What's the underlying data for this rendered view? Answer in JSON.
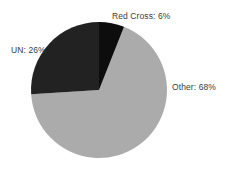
{
  "chart_data": {
    "type": "pie",
    "title": "",
    "categories": [
      "Red Cross",
      "UN",
      "Other"
    ],
    "values": [
      6,
      26,
      68
    ],
    "labels": [
      "Red Cross: 6%",
      "UN: 26%",
      "Other: 68%"
    ],
    "units": "percent",
    "total": 100,
    "legend_position": "none",
    "grid": false,
    "xlabel": "",
    "ylabel": "",
    "start_angle_deg": 0,
    "direction": "clockwise",
    "slices": [
      {
        "name": "Red Cross",
        "value": 6,
        "label": "Red Cross: 6%",
        "color": "#0d0d0d",
        "start_deg": 0,
        "end_deg": 21.6,
        "label_position": "top-right-outside"
      },
      {
        "name": "Other",
        "value": 68,
        "label": "Other: 68%",
        "color": "#ababab",
        "start_deg": 21.6,
        "end_deg": 266.4,
        "label_position": "right-outside"
      },
      {
        "name": "UN",
        "value": 26,
        "label": "UN: 26%",
        "color": "#222222",
        "start_deg": 266.4,
        "end_deg": 360,
        "label_position": "left-outside"
      }
    ]
  },
  "colors": {
    "background": "#ffffff",
    "red_cross_slice": "#0d0d0d",
    "un_slice": "#222222",
    "other_slice": "#ababab",
    "label_text": "#3a3a3a"
  },
  "geometry": {
    "center_x": 99,
    "center_y": 90,
    "radius": 68
  }
}
